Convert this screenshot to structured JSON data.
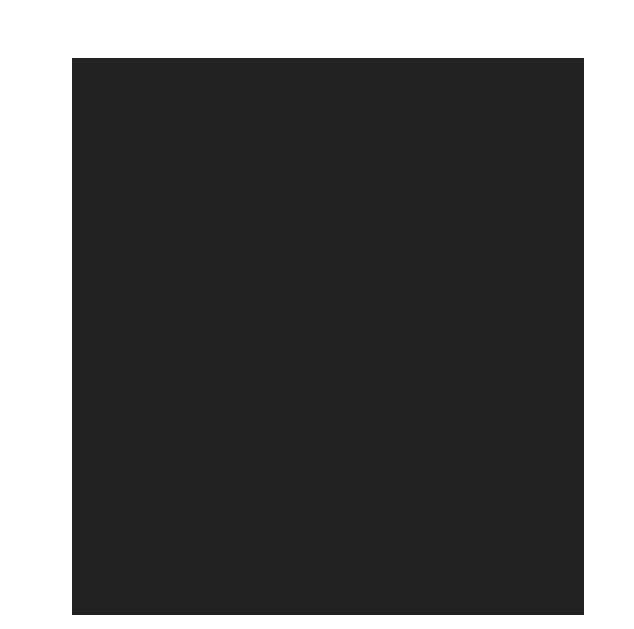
{
  "chart_data": {
    "type": "heatmap",
    "xlabel": "",
    "ylabel": "",
    "columns": [
      17,
      16,
      15,
      14,
      13,
      12,
      11,
      10,
      9,
      8,
      7,
      6,
      5,
      4,
      3,
      2,
      1
    ],
    "rows": [
      25,
      24,
      23,
      22,
      21,
      20,
      19,
      18,
      17,
      16,
      15,
      14,
      13,
      12,
      11,
      10,
      9,
      8,
      7,
      6,
      5,
      4,
      3,
      2,
      1
    ],
    "left_row_labels": [
      24,
      22,
      20,
      18,
      16,
      14,
      12,
      10,
      8,
      6,
      4,
      2
    ],
    "right_row_labels": [
      25,
      23,
      21,
      19,
      17,
      15,
      13,
      11,
      9,
      7,
      5,
      3,
      1
    ],
    "shade_legend": {
      "0": "light gray",
      "1": "medium gray",
      "2": "medium-dark gray",
      "3": "dark gray"
    },
    "colors": {
      "0": "#d6d6d6",
      "1": "#a9a9a9",
      "2": "#8a8a8a",
      "3": "#666666",
      "grid_line": "#222222"
    },
    "values": [
      [
        0,
        0,
        0,
        0,
        0,
        0,
        0,
        1,
        1,
        1,
        0,
        0,
        0,
        0,
        0,
        0,
        1
      ],
      [
        0,
        0,
        0,
        0,
        0,
        0,
        0,
        1,
        1,
        1,
        1,
        0,
        0,
        0,
        0,
        1,
        1
      ],
      [
        0,
        0,
        0,
        0,
        0,
        0,
        0,
        1,
        1,
        1,
        1,
        1,
        0,
        0,
        1,
        1,
        1
      ],
      [
        0,
        0,
        0,
        0,
        0,
        0,
        0,
        0,
        1,
        1,
        1,
        1,
        0,
        1,
        1,
        1,
        1
      ],
      [
        0,
        0,
        0,
        0,
        2,
        2,
        3,
        3,
        3,
        1,
        1,
        1,
        0,
        1,
        1,
        1,
        0
      ],
      [
        0,
        0,
        0,
        0,
        2,
        3,
        3,
        3,
        3,
        3,
        1,
        1,
        0,
        1,
        1,
        0,
        0
      ],
      [
        0,
        0,
        0,
        2,
        3,
        3,
        2,
        2,
        2,
        2,
        2,
        2,
        2,
        2,
        0,
        0,
        0
      ],
      [
        0,
        0,
        0,
        2,
        3,
        2,
        2,
        2,
        2,
        2,
        3,
        3,
        3,
        2,
        2,
        2,
        0
      ],
      [
        0,
        0,
        0,
        0,
        3,
        2,
        2,
        2,
        2,
        2,
        3,
        3,
        3,
        3,
        2,
        2,
        0
      ],
      [
        0,
        0,
        0,
        2,
        3,
        2,
        2,
        3,
        2,
        2,
        2,
        2,
        2,
        3,
        2,
        2,
        0
      ],
      [
        0,
        0,
        0,
        2,
        3,
        2,
        2,
        3,
        3,
        2,
        2,
        2,
        2,
        2,
        2,
        2,
        0
      ],
      [
        0,
        0,
        0,
        2,
        3,
        2,
        2,
        2,
        3,
        2,
        2,
        2,
        3,
        2,
        2,
        2,
        0
      ],
      [
        0,
        0,
        0,
        0,
        3,
        2,
        2,
        2,
        3,
        3,
        2,
        2,
        3,
        2,
        2,
        2,
        0
      ],
      [
        0,
        0,
        0,
        0,
        2,
        2,
        2,
        2,
        3,
        3,
        2,
        2,
        3,
        2,
        2,
        2,
        0
      ],
      [
        0,
        0,
        0,
        0,
        0,
        2,
        2,
        3,
        3,
        3,
        2,
        3,
        3,
        2,
        2,
        2,
        0
      ],
      [
        0,
        0,
        0,
        0,
        0,
        0,
        2,
        2,
        3,
        2,
        2,
        2,
        2,
        2,
        2,
        0,
        0
      ],
      [
        0,
        0,
        0,
        0,
        0,
        0,
        0,
        2,
        2,
        2,
        0,
        0,
        2,
        2,
        0,
        0,
        0
      ],
      [
        0,
        0,
        0,
        0,
        1,
        1,
        0,
        0,
        1,
        0,
        0,
        0,
        0,
        0,
        0,
        0,
        0
      ],
      [
        0,
        1,
        1,
        1,
        1,
        1,
        1,
        1,
        0,
        0,
        0,
        0,
        0,
        0,
        0,
        0,
        0
      ],
      [
        0,
        1,
        3,
        3,
        2,
        1,
        1,
        0,
        0,
        0,
        0,
        0,
        0,
        0,
        0,
        0,
        0
      ],
      [
        0,
        3,
        3,
        3,
        2,
        1,
        1,
        0,
        0,
        0,
        0,
        0,
        0,
        0,
        0,
        0,
        0
      ],
      [
        0,
        3,
        3,
        2,
        2,
        1,
        1,
        0,
        0,
        0,
        0,
        0,
        0,
        0,
        0,
        0,
        0
      ],
      [
        3,
        3,
        2,
        2,
        1,
        1,
        1,
        0,
        0,
        0,
        0,
        0,
        0,
        0,
        0,
        0,
        0
      ],
      [
        3,
        2,
        2,
        1,
        1,
        1,
        0,
        0,
        0,
        0,
        0,
        0,
        0,
        0,
        0,
        0,
        0
      ],
      [
        2,
        2,
        0,
        1,
        1,
        0,
        0,
        0,
        0,
        0,
        0,
        0,
        0,
        0,
        0,
        0,
        0
      ]
    ],
    "grid": true,
    "legend": "none"
  }
}
